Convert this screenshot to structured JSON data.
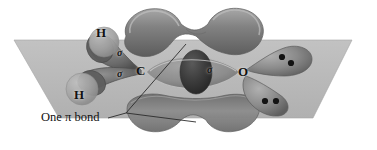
{
  "figure": {
    "kind": "orbital-bonding-diagram",
    "molecule": "formaldehyde",
    "background_color": "#ffffff"
  },
  "plane": {
    "name": "sigma-framework-plane",
    "fill_color": "#b9b9b9",
    "edge_color": "#9a9a9a",
    "points": "14,40 352,40 313,118 59,118"
  },
  "atoms": [
    {
      "id": "h-top",
      "label": "H",
      "x": 100,
      "y": 29,
      "font_size": 13
    },
    {
      "id": "h-bottom",
      "label": "H",
      "x": 78,
      "y": 90,
      "font_size": 13
    },
    {
      "id": "carbon",
      "label": "C",
      "x": 138,
      "y": 65,
      "font_size": 13
    },
    {
      "id": "oxygen",
      "label": "O",
      "x": 240,
      "y": 66,
      "font_size": 13
    }
  ],
  "bond_labels": [
    {
      "id": "sigma-c-h-top",
      "label": "σ",
      "x": 119,
      "y": 52
    },
    {
      "id": "sigma-c-h-bottom",
      "label": "σ",
      "x": 119,
      "y": 72
    },
    {
      "id": "sigma-c-o",
      "label": "σ",
      "x": 209,
      "y": 68
    }
  ],
  "caption": {
    "text": "One π bond",
    "x": 44,
    "y": 117,
    "leader_color": "#2b2b2b"
  },
  "lone_pairs": [
    {
      "id": "oxygen-lone-pair-upper",
      "dots": [
        {
          "x": 282,
          "y": 57
        },
        {
          "x": 290,
          "y": 62
        }
      ],
      "radius": 3.1
    },
    {
      "id": "oxygen-lone-pair-lower",
      "dots": [
        {
          "x": 265,
          "y": 100
        },
        {
          "x": 275,
          "y": 100
        }
      ],
      "radius": 3.1
    }
  ],
  "orbitals": {
    "pi_top": {
      "name": "pi-lobe-top",
      "fill_color": "#7e7e7e",
      "highlight_color": "#a9a9a9",
      "shade_color": "#5e5e5e"
    },
    "pi_bottom": {
      "name": "pi-lobe-bottom",
      "fill_color": "#8a8a8a",
      "highlight_color": "#a2a2a2",
      "shade_color": "#646464"
    },
    "sigma_co": {
      "name": "sigma-co-orbital",
      "fill_color": "#8d8d8d",
      "core_color": "#3a3a3a"
    },
    "oxygen_lobes": {
      "name": "oxygen-lone-pair-lobes",
      "fill_color": "#8c8c8c",
      "shade_color": "#6a6a6a"
    },
    "carbon_lobes": {
      "name": "carbon-sp2-lobes",
      "fill_color": "#8f8f8f",
      "shade_color": "#5a5a5a"
    },
    "hydrogen_s": {
      "name": "hydrogen-s-orbitals",
      "fill_color": "#a6a6a6",
      "shade_color": "#858585"
    }
  },
  "colors": {
    "ink": "#111111",
    "plane_gray": "#b9b9b9",
    "mid_gray": "#8a8a8a",
    "dark_gray": "#3a3a3a"
  }
}
